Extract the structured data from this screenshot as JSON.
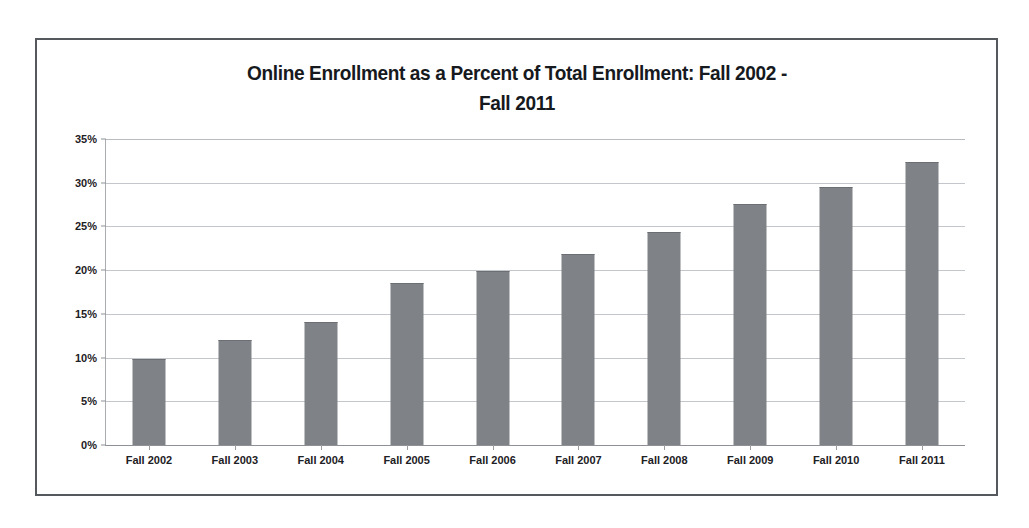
{
  "chart_data": {
    "type": "bar",
    "title": "Online Enrollment as a Percent of Total Enrollment: Fall 2002 - Fall 2011",
    "title_line1": "Online Enrollment as a Percent of Total Enrollment: Fall 2002 -",
    "title_line2": "Fall 2011",
    "xlabel": "",
    "ylabel": "",
    "categories": [
      "Fall 2002",
      "Fall 2003",
      "Fall 2004",
      "Fall 2005",
      "Fall 2006",
      "Fall 2007",
      "Fall 2008",
      "Fall 2009",
      "Fall 2010",
      "Fall 2011"
    ],
    "values": [
      9.7,
      11.9,
      14.0,
      18.4,
      19.8,
      21.7,
      24.3,
      27.5,
      29.4,
      32.2
    ],
    "ylim": [
      0,
      35
    ],
    "ytick_values": [
      0,
      5,
      10,
      15,
      20,
      25,
      30,
      35
    ],
    "ytick_labels": [
      "0%",
      "5%",
      "10%",
      "15%",
      "20%",
      "25%",
      "30%",
      "35%"
    ],
    "grid": true,
    "legend": false,
    "legend_position": "none",
    "bar_color": "#7f8286",
    "gridline_color": "#c3c7cc",
    "axis_color": "#8d9196",
    "frame_color": "#55585c",
    "background_color": "#ffffff",
    "text_color": "#1d2024"
  }
}
